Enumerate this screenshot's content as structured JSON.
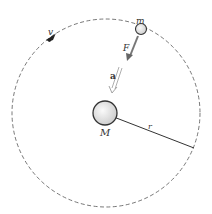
{
  "diagram": {
    "labels": {
      "small_mass": "m",
      "large_mass": "M",
      "force": "F",
      "acceleration": "a",
      "velocity": "v",
      "radius": "r"
    },
    "colors": {
      "orbit": "#555555",
      "force_arrow": "#777777",
      "accel_arrow": "#999999",
      "mass_fill": "#e6e6e6",
      "mass_stroke": "#333333"
    }
  }
}
